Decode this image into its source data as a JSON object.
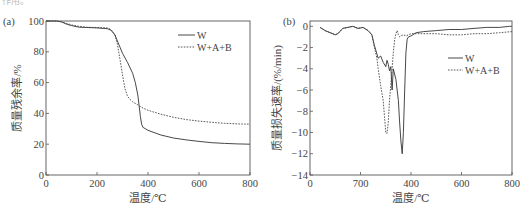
{
  "page": {
    "top_fragment": "作用。"
  },
  "chart_data": [
    {
      "id": "a",
      "type": "line",
      "panel_label": "(a)",
      "title": "",
      "xlabel": "温度/℃",
      "ylabel": "质量残余率/%",
      "xlim": [
        0,
        800
      ],
      "ylim": [
        0,
        100
      ],
      "xticks": [
        0,
        200,
        400,
        600,
        800
      ],
      "yticks": [
        0,
        20,
        40,
        60,
        80,
        100
      ],
      "grid": false,
      "legend_position": "upper right",
      "series": [
        {
          "name": "W",
          "style": "solid",
          "x": [
            0,
            40,
            60,
            80,
            100,
            130,
            160,
            200,
            240,
            255,
            270,
            285,
            300,
            320,
            340,
            350,
            360,
            365,
            370,
            375,
            380,
            400,
            450,
            500,
            550,
            600,
            650,
            700,
            750,
            800
          ],
          "y": [
            100,
            100,
            99.5,
            98,
            97,
            96,
            95.8,
            95.5,
            95,
            94,
            91,
            85,
            79,
            73,
            66,
            60,
            52,
            45,
            38,
            33,
            31,
            29,
            26,
            24,
            22.8,
            21.8,
            21,
            20.5,
            20.2,
            20
          ]
        },
        {
          "name": "W+A+B",
          "style": "dashed",
          "x": [
            0,
            40,
            60,
            80,
            100,
            130,
            160,
            200,
            240,
            255,
            270,
            280,
            290,
            300,
            310,
            320,
            330,
            340,
            360,
            380,
            400,
            450,
            500,
            550,
            600,
            650,
            700,
            750,
            800
          ],
          "y": [
            100,
            100,
            99.5,
            98.5,
            97.5,
            96.5,
            96,
            95.8,
            95.5,
            94.5,
            91,
            85,
            75,
            65,
            56,
            51,
            49,
            47.5,
            45.5,
            43.5,
            42,
            39.5,
            37.5,
            36,
            35,
            34.2,
            33.6,
            33.2,
            33
          ]
        }
      ]
    },
    {
      "id": "b",
      "type": "line",
      "panel_label": "(b)",
      "title": "",
      "xlabel": "温度/℃",
      "ylabel": "质量损失速率/(%/min)",
      "xlim": [
        0,
        800
      ],
      "ylim": [
        -14,
        0.5
      ],
      "xticks": [
        0,
        200,
        400,
        600,
        800
      ],
      "xtick_labels": [
        "0",
        "700",
        "400",
        "600",
        "800"
      ],
      "yticks": [
        0,
        -2,
        -4,
        -6,
        -8,
        -10,
        -12,
        -14
      ],
      "grid": false,
      "legend_position": "center right",
      "series": [
        {
          "name": "W",
          "style": "solid",
          "x": [
            40,
            60,
            80,
            100,
            110,
            130,
            150,
            170,
            190,
            210,
            230,
            245,
            255,
            265,
            270,
            280,
            290,
            300,
            305,
            310,
            315,
            320,
            325,
            330,
            340,
            350,
            355,
            360,
            365,
            370,
            375,
            380,
            385,
            390,
            400,
            420,
            450,
            500,
            550,
            600,
            650,
            700,
            750,
            790,
            800
          ],
          "y": [
            -0.1,
            -0.4,
            -0.6,
            -0.8,
            -0.7,
            -0.2,
            -0.1,
            0,
            -0.2,
            -0.1,
            -0.4,
            -0.8,
            -1.8,
            -2.6,
            -3.0,
            -2.8,
            -3.4,
            -3.8,
            -3.2,
            -3.6,
            -4.2,
            -3.8,
            -6.0,
            -4.0,
            -5.0,
            -7.0,
            -9.0,
            -10.8,
            -12.0,
            -10.0,
            -6.0,
            -2.5,
            -1.2,
            -1.0,
            -0.9,
            -0.6,
            -0.5,
            -0.4,
            -0.3,
            -0.3,
            -0.2,
            -0.1,
            -0.1,
            0,
            0
          ]
        },
        {
          "name": "W+A+B",
          "style": "dashed",
          "x": [
            40,
            60,
            80,
            100,
            110,
            130,
            150,
            170,
            190,
            210,
            230,
            245,
            255,
            265,
            270,
            280,
            290,
            295,
            300,
            305,
            310,
            315,
            320,
            325,
            330,
            335,
            340,
            345,
            350,
            355,
            360,
            370,
            380,
            400,
            450,
            500,
            550,
            600,
            650,
            700,
            750,
            800
          ],
          "y": [
            -0.1,
            -0.4,
            -0.6,
            -0.8,
            -0.7,
            -0.2,
            -0.1,
            0,
            -0.2,
            -0.1,
            -0.4,
            -0.8,
            -2.0,
            -3.0,
            -4.0,
            -5.6,
            -7.0,
            -8.5,
            -10.0,
            -10.1,
            -9.0,
            -7.0,
            -5.5,
            -4.0,
            -2.5,
            -1.3,
            -0.7,
            -0.4,
            -0.8,
            -1.0,
            -0.9,
            -0.8,
            -0.9,
            -0.7,
            -0.7,
            -0.7,
            -0.8,
            -0.8,
            -0.7,
            -0.7,
            -0.6,
            -0.5
          ]
        }
      ]
    }
  ]
}
